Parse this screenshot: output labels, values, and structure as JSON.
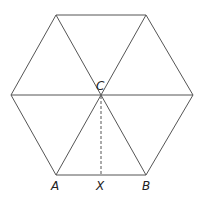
{
  "diagram": {
    "labels": {
      "A": "A",
      "B": "B",
      "C": "C",
      "X": "X"
    },
    "colors": {
      "stroke": "#555555",
      "background": "#ffffff",
      "text": "#222222"
    }
  }
}
